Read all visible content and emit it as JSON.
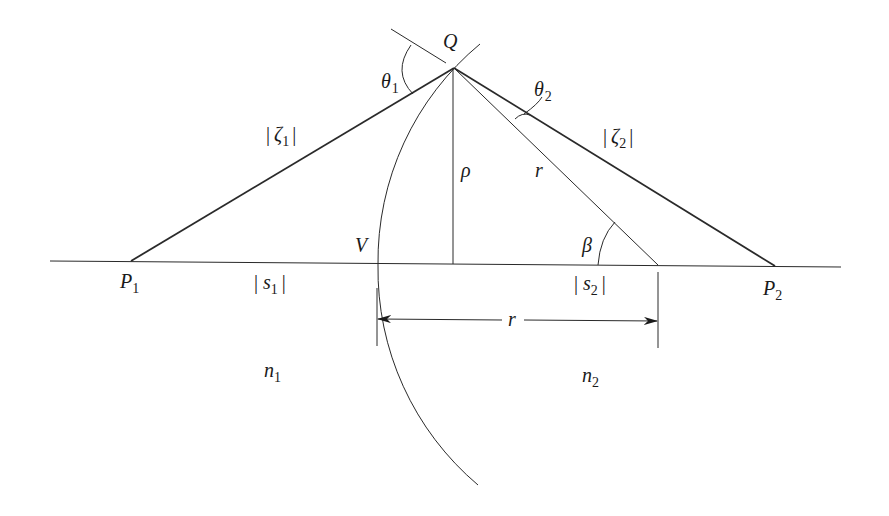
{
  "diagram": {
    "type": "refraction at a spherical surface",
    "labels": {
      "Q": {
        "text": "Q"
      },
      "theta1": {
        "text": "θ",
        "sub": "1"
      },
      "theta2": {
        "text": "θ",
        "sub": "2"
      },
      "zeta1": {
        "bar_l": "|",
        "text": "ζ",
        "sub": "1",
        "bar_r": "|"
      },
      "zeta2": {
        "bar_l": "|",
        "text": "ζ",
        "sub": "2",
        "bar_r": "|"
      },
      "rho": {
        "text": "ρ"
      },
      "r_radius": {
        "text": "r"
      },
      "beta": {
        "text": "β"
      },
      "V": {
        "text": "V"
      },
      "P1": {
        "text": "P",
        "sub": "1"
      },
      "P2": {
        "text": "P",
        "sub": "2"
      },
      "s1": {
        "bar_l": "|",
        "text": "s",
        "sub": "1",
        "bar_r": "|"
      },
      "s2": {
        "bar_l": "|",
        "text": "s",
        "sub": "2",
        "bar_r": "|"
      },
      "r_dim": {
        "text": "r"
      },
      "n1": {
        "text": "n",
        "sub": "1"
      },
      "n2": {
        "text": "n",
        "sub": "2"
      }
    },
    "colors": {
      "line": "#2a2a2a",
      "text": "#1a1a1a",
      "background": "#ffffff"
    }
  }
}
